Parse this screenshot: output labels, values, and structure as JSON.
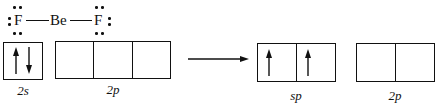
{
  "lewis_structure": {
    "left_atom": "F",
    "center_atom": "Be",
    "right_atom": "F"
  },
  "ground_state": {
    "orbitals": [
      {
        "label": "2s",
        "cells": 1,
        "electrons": [
          "up",
          "down"
        ]
      },
      {
        "label": "2p",
        "cells": 3,
        "electrons": []
      }
    ]
  },
  "arrow": "reaction-arrow",
  "hybridized_state": {
    "orbitals": [
      {
        "label": "sp",
        "cells": 2,
        "electrons": [
          "up",
          "up"
        ]
      },
      {
        "label": "2p",
        "cells": 2,
        "electrons": []
      }
    ]
  },
  "labels": {
    "s2": "2s",
    "p2_left": "2p",
    "sp": "sp",
    "p2_right": "2p"
  },
  "atoms": {
    "f_left": "F",
    "be": "Be",
    "f_right": "F"
  }
}
